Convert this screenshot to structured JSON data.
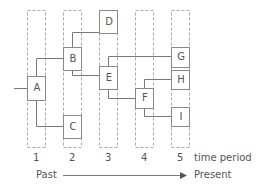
{
  "diagram": {
    "columns": [
      {
        "id": "1",
        "label": "1",
        "x": 27
      },
      {
        "id": "2",
        "label": "2",
        "x": 63
      },
      {
        "id": "3",
        "label": "3",
        "x": 99
      },
      {
        "id": "4",
        "label": "4",
        "x": 135
      },
      {
        "id": "5",
        "label": "5",
        "x": 171
      }
    ],
    "nodes": [
      {
        "id": "A",
        "label": "A",
        "column": 1,
        "x": 27,
        "y": 76,
        "w": 18,
        "h": 24
      },
      {
        "id": "B",
        "label": "B",
        "column": 2,
        "x": 63,
        "y": 47,
        "w": 18,
        "h": 23
      },
      {
        "id": "C",
        "label": "C",
        "column": 2,
        "x": 63,
        "y": 115,
        "w": 18,
        "h": 23
      },
      {
        "id": "D",
        "label": "D",
        "column": 3,
        "x": 99,
        "y": 10,
        "w": 18,
        "h": 23
      },
      {
        "id": "E",
        "label": "E",
        "column": 3,
        "x": 99,
        "y": 66,
        "w": 18,
        "h": 23
      },
      {
        "id": "F",
        "label": "F",
        "column": 4,
        "x": 135,
        "y": 88,
        "w": 18,
        "h": 20
      },
      {
        "id": "G",
        "label": "G",
        "column": 5,
        "x": 171,
        "y": 47,
        "w": 18,
        "h": 20
      },
      {
        "id": "H",
        "label": "H",
        "column": 5,
        "x": 171,
        "y": 70,
        "w": 18,
        "h": 19
      },
      {
        "id": "I",
        "label": "I",
        "column": 5,
        "x": 171,
        "y": 107,
        "w": 18,
        "h": 19
      }
    ],
    "edges": [
      {
        "from": "input",
        "to": "A"
      },
      {
        "from": "A",
        "to": "B"
      },
      {
        "from": "A",
        "to": "C"
      },
      {
        "from": "B",
        "to": "D"
      },
      {
        "from": "B",
        "to": "E"
      },
      {
        "from": "E",
        "to": "G"
      },
      {
        "from": "E",
        "to": "F"
      },
      {
        "from": "F",
        "to": "H"
      },
      {
        "from": "F",
        "to": "I"
      }
    ],
    "axis": {
      "time_label": "time period",
      "past_label": "Past",
      "present_label": "Present"
    },
    "colors": {
      "line": "#7a7a7a",
      "box": "#8a8a8a",
      "dash": "#aaaaaa",
      "text": "#555555"
    }
  }
}
